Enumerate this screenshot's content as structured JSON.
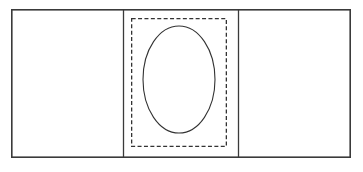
{
  "figure": {
    "title": "Three-panel line drawing with dashed inset and ellipse",
    "canvas": {
      "width": 363,
      "height": 172,
      "background_color": "#ffffff"
    },
    "style": {
      "stroke_color": "#333333",
      "outer_stroke_color": "#3a3a3a",
      "outer_stroke_width": 1.6,
      "divider_stroke_width": 1.3,
      "dashed_stroke_width": 1.3,
      "dash_pattern": "4 2.4",
      "ellipse_stroke_width": 1.1,
      "fill": "none"
    },
    "shapes": [
      {
        "name": "outer-rectangle",
        "type": "rect",
        "x": 11,
        "y": 9,
        "width": 340,
        "height": 149,
        "stroke": "solid",
        "fill": "none"
      },
      {
        "name": "left-divider-line",
        "type": "line",
        "x1": 123.5,
        "y1": 9,
        "x2": 123.5,
        "y2": 158,
        "stroke": "solid"
      },
      {
        "name": "right-divider-line",
        "type": "line",
        "x1": 238.5,
        "y1": 9,
        "x2": 238.5,
        "y2": 158,
        "stroke": "solid"
      },
      {
        "name": "dashed-inset-rectangle",
        "type": "rect",
        "x": 131,
        "y": 18,
        "width": 96,
        "height": 129,
        "stroke": "dashed",
        "fill": "none"
      },
      {
        "name": "center-ellipse",
        "type": "ellipse",
        "cx": 179,
        "cy": 79.5,
        "rx": 36,
        "ry": 53.5,
        "stroke": "solid",
        "fill": "none"
      }
    ],
    "panels": [
      {
        "name": "left-panel",
        "x": 11,
        "width": 112.5,
        "contents": "empty"
      },
      {
        "name": "center-panel",
        "x": 123.5,
        "width": 115,
        "contents": "dashed rectangle containing ellipse"
      },
      {
        "name": "right-panel",
        "x": 238.5,
        "width": 112.5,
        "contents": "empty"
      }
    ],
    "labels": []
  }
}
